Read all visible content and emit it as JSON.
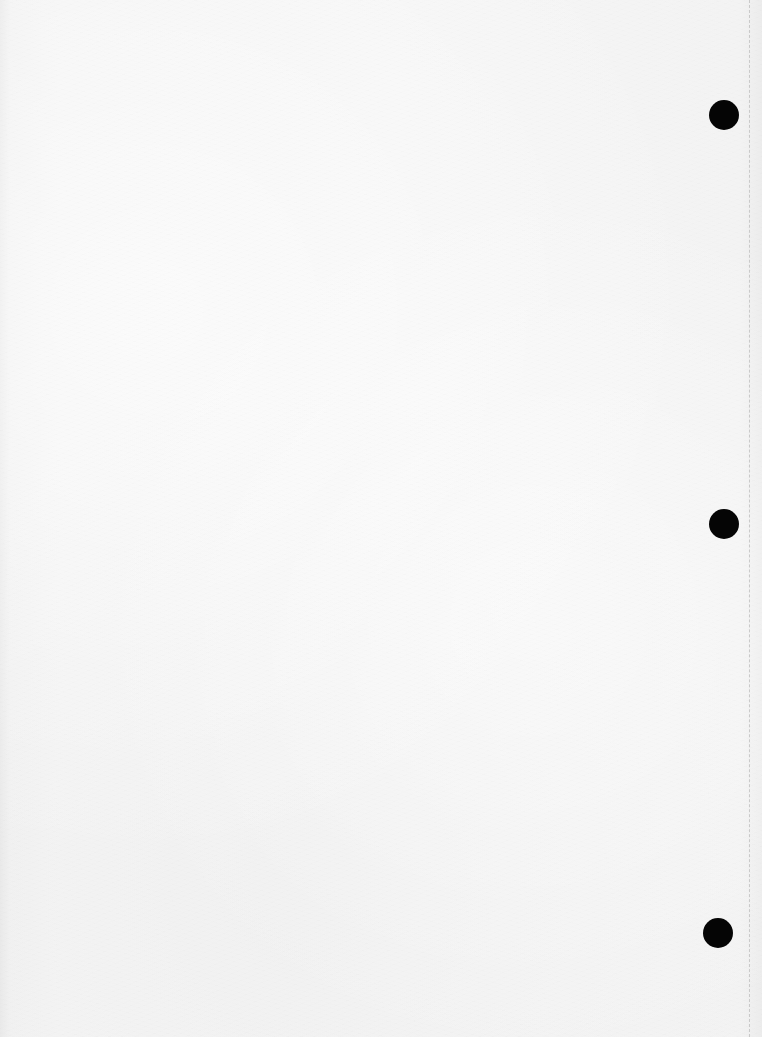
{
  "page": {
    "type": "blank-scanned-sheet",
    "background_color": "#f3f3f3",
    "text_content": ""
  },
  "punch_holes": [
    {
      "cx": 724,
      "cy": 115,
      "r": 15,
      "color": "#050505"
    },
    {
      "cx": 724,
      "cy": 524,
      "r": 15,
      "color": "#050505"
    },
    {
      "cx": 718,
      "cy": 933,
      "r": 15,
      "color": "#050505"
    }
  ],
  "perforation": {
    "x": 749,
    "style": "dashed",
    "color": "#c9c9c9"
  }
}
